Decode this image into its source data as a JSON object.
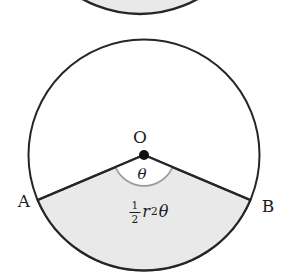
{
  "figure": {
    "center_label": "O",
    "angle_label": "θ",
    "point_a_label": "A",
    "point_b_label": "B",
    "formula": {
      "numerator": "1",
      "denominator": "2",
      "variable": "r",
      "exponent": "2",
      "angle": "θ"
    }
  },
  "colors": {
    "background": "#ffffff",
    "shade_fill": "#e9e9e9",
    "line": "#262626",
    "angle_arc": "#9a9a9a",
    "dot": "#111111"
  }
}
